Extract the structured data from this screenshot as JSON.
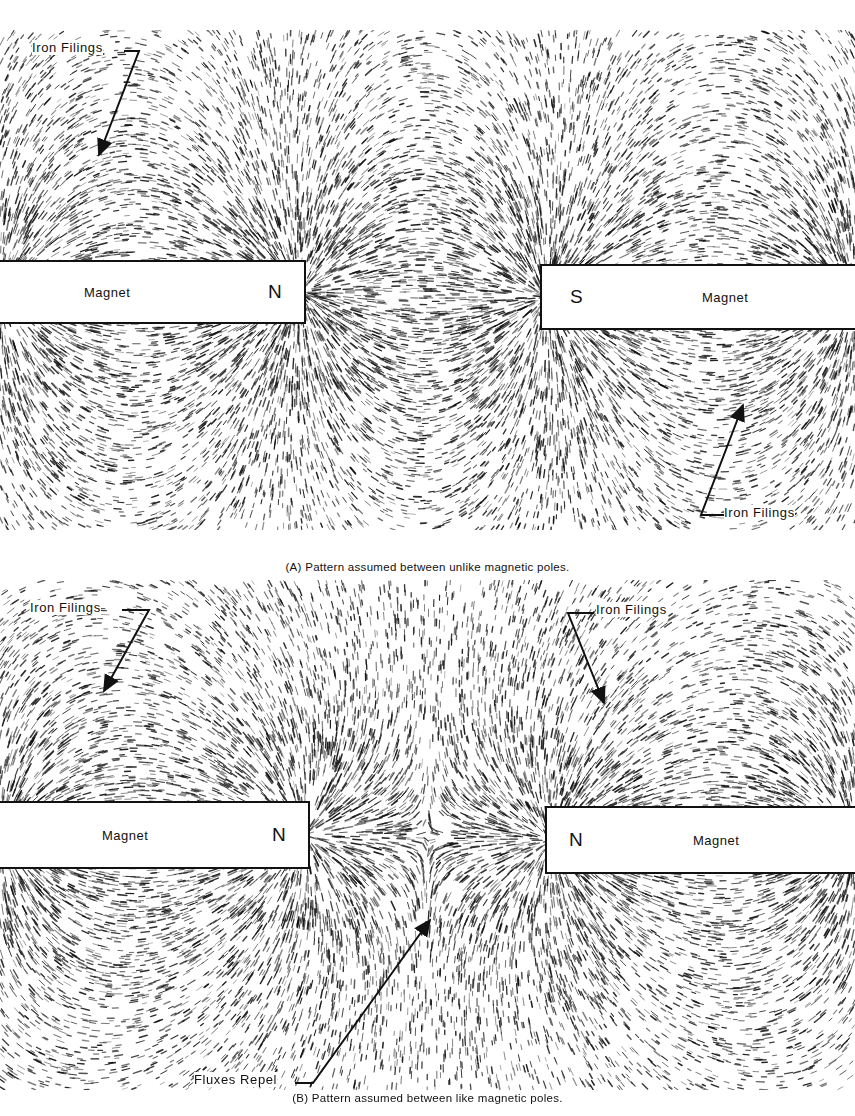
{
  "panel_a": {
    "caption": "(A) Pattern assumed between unlike magnetic poles.",
    "left_magnet": {
      "label": "Magnet",
      "pole": "N"
    },
    "right_magnet": {
      "label": "Magnet",
      "pole": "S"
    },
    "callouts": [
      {
        "text": "Iron Filings",
        "position": "top-left"
      },
      {
        "text": "Iron Filings",
        "position": "bottom-right"
      }
    ],
    "field_type": "unlike-poles"
  },
  "panel_b": {
    "caption": "(B) Pattern assumed between like magnetic poles.",
    "left_magnet": {
      "label": "Magnet",
      "pole": "N"
    },
    "right_magnet": {
      "label": "Magnet",
      "pole": "N"
    },
    "callouts": [
      {
        "text": "Iron Filings",
        "position": "top-left"
      },
      {
        "text": "Iron Filings",
        "position": "top-center-right"
      },
      {
        "text": "Fluxes Repel",
        "position": "bottom-center"
      }
    ],
    "field_type": "like-poles"
  },
  "colors": {
    "ink": "#111111",
    "paper": "#ffffff"
  }
}
